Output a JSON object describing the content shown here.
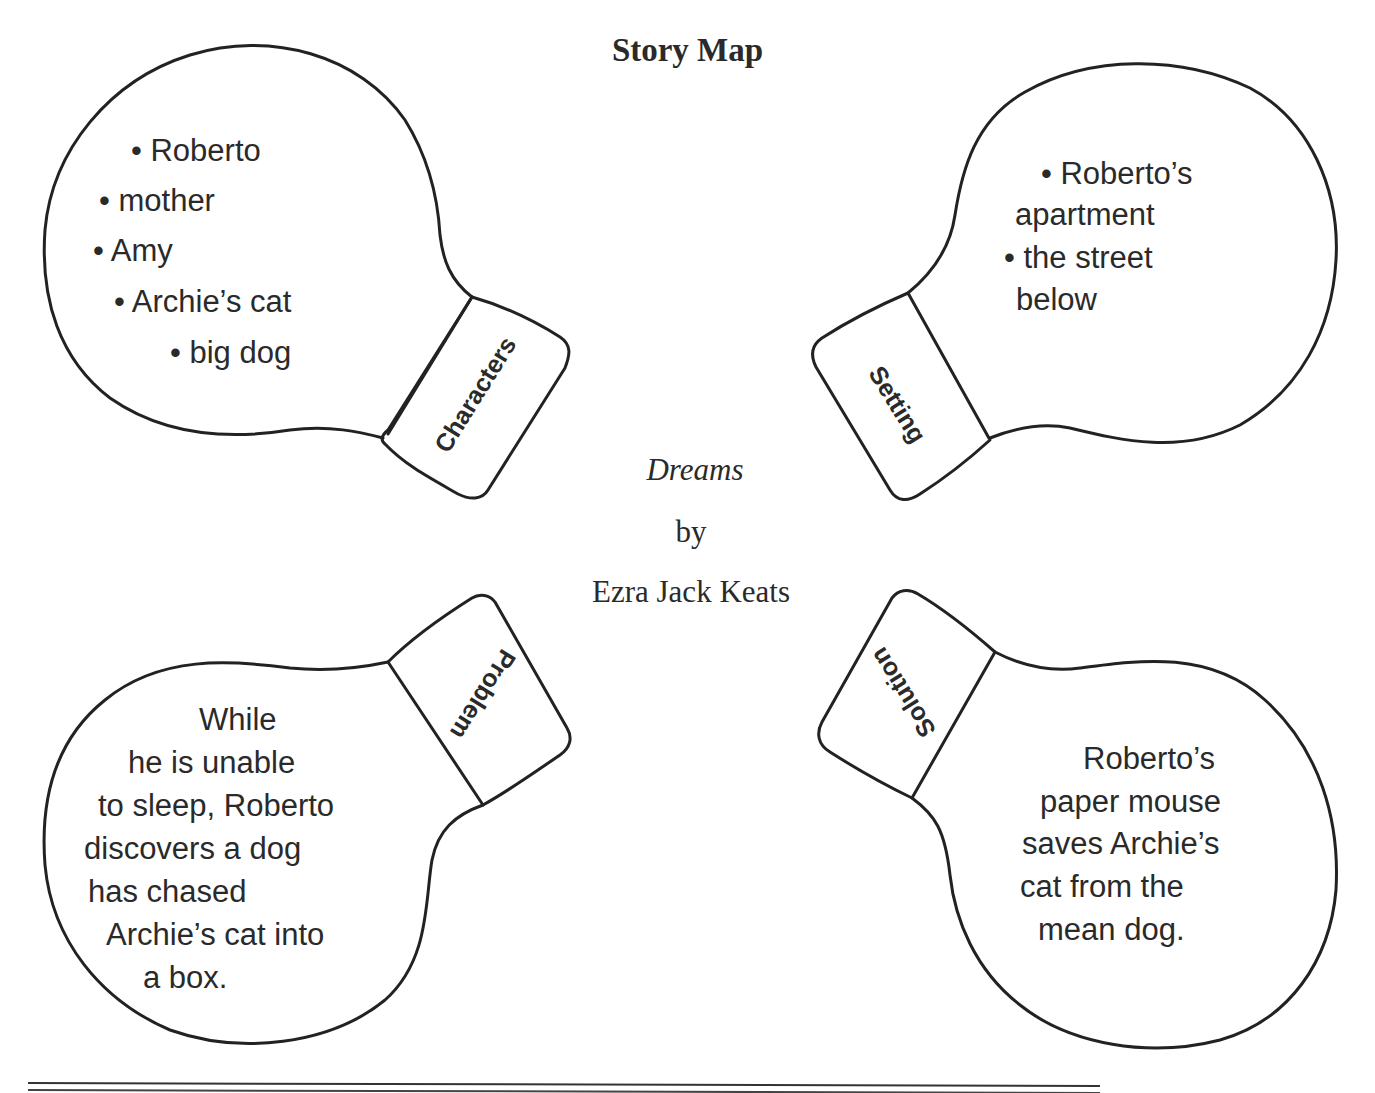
{
  "page": {
    "title": "Story Map",
    "book": {
      "title": "Dreams",
      "by": "by",
      "author": "Ezra Jack Keats"
    }
  },
  "bulbs": {
    "characters": {
      "label": "Characters",
      "lines": [
        "• Roberto",
        "• mother",
        "• Amy",
        "• Archie’s cat",
        "• big dog"
      ]
    },
    "setting": {
      "label": "Setting",
      "lines": [
        "• Roberto’s",
        "apartment",
        "• the street",
        "below"
      ]
    },
    "problem": {
      "label": "Problem",
      "lines": [
        "While",
        "he is unable",
        "to sleep, Roberto",
        "discovers a dog",
        "has chased",
        "Archie’s cat into",
        "a box."
      ]
    },
    "solution": {
      "label": "Solution",
      "lines": [
        "Roberto’s",
        "paper mouse",
        "saves Archie’s",
        "cat from the",
        "mean dog."
      ]
    }
  },
  "colors": {
    "ink": "#222222",
    "paper": "#ffffff"
  }
}
